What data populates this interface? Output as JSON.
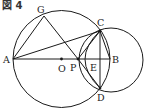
{
  "figure": {
    "label": "図 4"
  },
  "points": {
    "A": {
      "label": "A",
      "x": 13,
      "y": 59
    },
    "B": {
      "label": "B",
      "x": 110,
      "y": 59
    },
    "O": {
      "label": "O",
      "x": 61.5,
      "y": 59
    },
    "G": {
      "label": "G",
      "x": 44,
      "y": 16
    },
    "C": {
      "label": "C",
      "x": 100,
      "y": 31
    },
    "D": {
      "label": "D",
      "x": 100,
      "y": 88
    },
    "P": {
      "label": "P",
      "x": 78,
      "y": 59
    },
    "E": {
      "label": "E",
      "x": 100,
      "y": 59
    }
  },
  "circles": [
    {
      "name": "circle-O",
      "cx": 61.5,
      "cy": 59,
      "r": 48.5
    },
    {
      "name": "circle-right",
      "cx": 110,
      "cy": 60,
      "r": 32
    }
  ],
  "segments": [
    "A-G",
    "G-P",
    "A-C",
    "A-B",
    "C-D",
    "P-C",
    "P-D",
    "C-B"
  ],
  "colors": {
    "stroke": "#1a1a1a",
    "background": "#ffffff"
  }
}
